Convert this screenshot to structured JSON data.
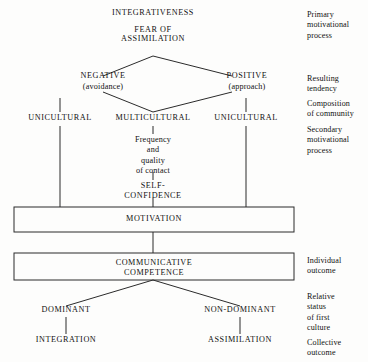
{
  "diagram": {
    "nodes": {
      "integrativeness": "INTEGRATIVENESS",
      "fear_of_assimilation": "FEAR OF\nASSIMILATION",
      "negative": "NEGATIVE",
      "avoidance": "(avoidance)",
      "positive": "POSITIVE",
      "approach": "(approach)",
      "unicultural_left": "UNICULTURAL",
      "multicultural": "MULTICULTURAL",
      "unicultural_right": "UNICULTURAL",
      "frequency_quality": "Frequency\nand\nquality\nof contact",
      "self_confidence": "SELF-\nCONFIDENCE",
      "motivation": "MOTIVATION",
      "communicative_competence": "COMMUNICATIVE\nCOMPETENCE",
      "dominant": "DOMINANT",
      "non_dominant": "NON-DOMINANT",
      "integration": "INTEGRATION",
      "assimilation": "ASSIMILATION"
    },
    "annotations": [
      {
        "id": "primary-motivational-process",
        "text": "Primary\nmotivational\nprocess"
      },
      {
        "id": "resulting-tendency",
        "text": "Resulting\ntendency"
      },
      {
        "id": "composition-of-community",
        "text": "Composition\nof community"
      },
      {
        "id": "secondary-motivational-process",
        "text": "Secondary\nmotivational\nprocess"
      },
      {
        "id": "individual-outcome",
        "text": "Individual\noutcome"
      },
      {
        "id": "relative-status-of-first-culture",
        "text": "Relative\nstatus\nof first\nculture"
      },
      {
        "id": "collective-outcome",
        "text": "Collective\noutcome"
      }
    ],
    "colors": {
      "background": "#fdfdfc",
      "ink": "#111111",
      "line": "#2b2b2b",
      "box_border": "#2b2b2b"
    },
    "boxes": [
      {
        "id": "motivation-box",
        "label": "MOTIVATION"
      },
      {
        "id": "communicative-competence-box",
        "label": "COMMUNICATIVE\nCOMPETENCE"
      }
    ]
  }
}
